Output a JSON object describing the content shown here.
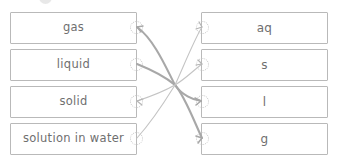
{
  "exercise": {
    "type": "matching-drag-and-drop",
    "title": "",
    "left_column": [
      {
        "id": "gas",
        "label": "gas"
      },
      {
        "id": "liquid",
        "label": "liquid"
      },
      {
        "id": "solid",
        "label": "solid"
      },
      {
        "id": "solution",
        "label": "solution in water"
      }
    ],
    "right_column": [
      {
        "id": "aq",
        "label": "aq"
      },
      {
        "id": "s",
        "label": "s"
      },
      {
        "id": "l",
        "label": "l"
      },
      {
        "id": "g",
        "label": "g"
      }
    ],
    "connections": [
      {
        "from": "gas",
        "to": "l",
        "weight": "thick"
      },
      {
        "from": "liquid",
        "to": "g",
        "weight": "thick"
      },
      {
        "from": "solid",
        "to": "s",
        "weight": "thin"
      },
      {
        "from": "solution",
        "to": "aq",
        "weight": "thin"
      }
    ],
    "colors": {
      "box_border": "#b9b9b9",
      "text": "#6f6f6f",
      "node_border": "#c2c2c2",
      "link_thick": "#a8a8a8",
      "link_thin": "#c4c4c4",
      "background": "#ffffff"
    }
  }
}
